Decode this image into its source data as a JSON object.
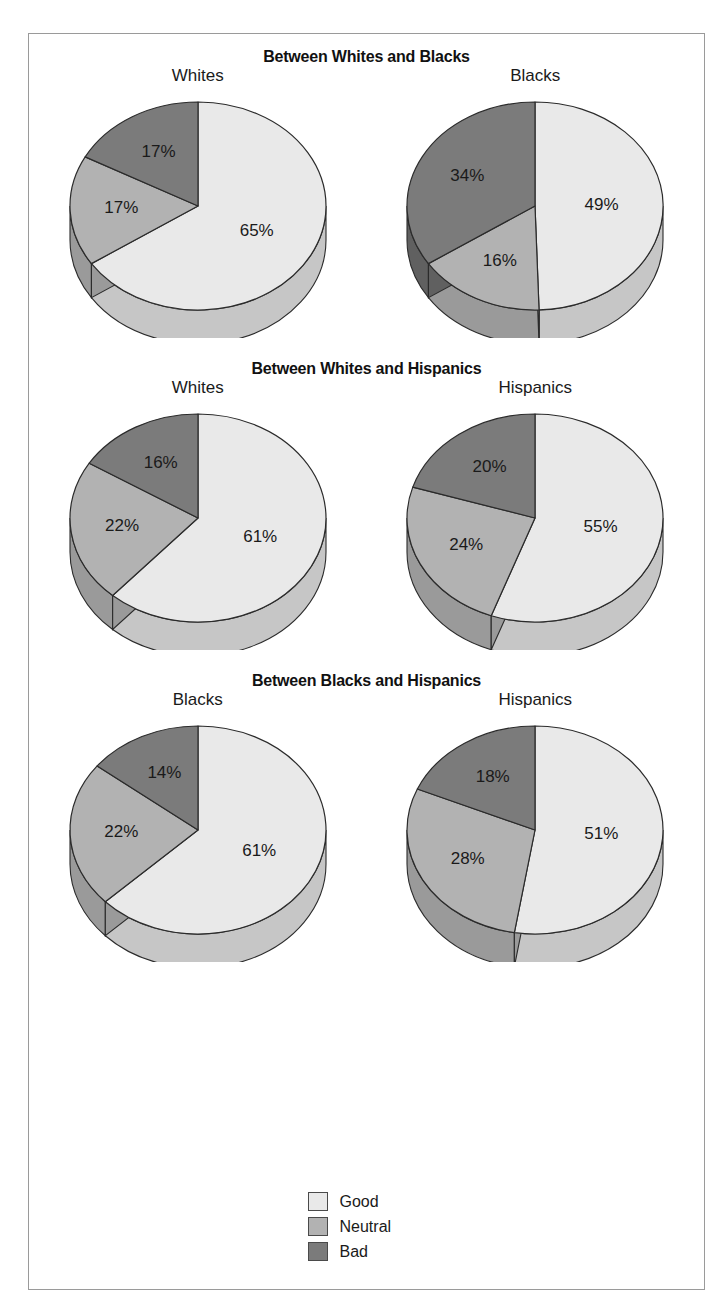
{
  "colors": {
    "good": "#e9e9e9",
    "good_side": "#c6c6c6",
    "neutral": "#b2b2b2",
    "neutral_side": "#9a9a9a",
    "bad": "#7b7b7b",
    "bad_side": "#606060",
    "outline": "#2b2b2b",
    "frame": "#9a9a9a",
    "text": "#1a1a1a"
  },
  "legend": {
    "items": [
      {
        "label": "Good",
        "color": "#e9e9e9"
      },
      {
        "label": "Neutral",
        "color": "#b2b2b2"
      },
      {
        "label": "Bad",
        "color": "#7b7b7b"
      }
    ]
  },
  "panels": [
    {
      "title": "Between Whites and Blacks",
      "charts": [
        {
          "group": "Whites",
          "slices": [
            {
              "category": "Good",
              "value": 65,
              "label": "65%"
            },
            {
              "category": "Neutral",
              "value": 17,
              "label": "17%"
            },
            {
              "category": "Bad",
              "value": 17,
              "label": "17%"
            }
          ]
        },
        {
          "group": "Blacks",
          "slices": [
            {
              "category": "Good",
              "value": 49,
              "label": "49%"
            },
            {
              "category": "Neutral",
              "value": 16,
              "label": "16%"
            },
            {
              "category": "Bad",
              "value": 34,
              "label": "34%"
            }
          ]
        }
      ]
    },
    {
      "title": "Between Whites and Hispanics",
      "charts": [
        {
          "group": "Whites",
          "slices": [
            {
              "category": "Good",
              "value": 61,
              "label": "61%"
            },
            {
              "category": "Neutral",
              "value": 22,
              "label": "22%"
            },
            {
              "category": "Bad",
              "value": 16,
              "label": "16%"
            }
          ]
        },
        {
          "group": "Hispanics",
          "slices": [
            {
              "category": "Good",
              "value": 55,
              "label": "55%"
            },
            {
              "category": "Neutral",
              "value": 24,
              "label": "24%"
            },
            {
              "category": "Bad",
              "value": 20,
              "label": "20%"
            }
          ]
        }
      ]
    },
    {
      "title": "Between Blacks and Hispanics",
      "charts": [
        {
          "group": "Blacks",
          "slices": [
            {
              "category": "Good",
              "value": 61,
              "label": "61%"
            },
            {
              "category": "Neutral",
              "value": 22,
              "label": "22%"
            },
            {
              "category": "Bad",
              "value": 14,
              "label": "14%"
            }
          ]
        },
        {
          "group": "Hispanics",
          "slices": [
            {
              "category": "Good",
              "value": 51,
              "label": "51%"
            },
            {
              "category": "Neutral",
              "value": 28,
              "label": "28%"
            },
            {
              "category": "Bad",
              "value": 18,
              "label": "18%"
            }
          ]
        }
      ]
    }
  ],
  "chart_data": {
    "type": "pie",
    "categories": [
      "Good",
      "Neutral",
      "Bad"
    ],
    "legend_position": "bottom-center",
    "note": "Six 3D pie charts arranged as three paired panels; slices begin at 12 o'clock and proceed clockwise in the order Good, Neutral, Bad.",
    "charts": [
      {
        "panel": "Between Whites and Blacks",
        "group": "Whites",
        "values": [
          65,
          17,
          17
        ],
        "labels": [
          "65%",
          "17%",
          "17%"
        ]
      },
      {
        "panel": "Between Whites and Blacks",
        "group": "Blacks",
        "values": [
          49,
          16,
          34
        ],
        "labels": [
          "49%",
          "16%",
          "34%"
        ]
      },
      {
        "panel": "Between Whites and Hispanics",
        "group": "Whites",
        "values": [
          61,
          22,
          16
        ],
        "labels": [
          "61%",
          "22%",
          "16%"
        ]
      },
      {
        "panel": "Between Whites and Hispanics",
        "group": "Hispanics",
        "values": [
          55,
          24,
          20
        ],
        "labels": [
          "55%",
          "24%",
          "20%"
        ]
      },
      {
        "panel": "Between Blacks and Hispanics",
        "group": "Blacks",
        "values": [
          61,
          22,
          14
        ],
        "labels": [
          "61%",
          "22%",
          "14%"
        ]
      },
      {
        "panel": "Between Blacks and Hispanics",
        "group": "Hispanics",
        "values": [
          51,
          28,
          18
        ],
        "labels": [
          "51%",
          "28%",
          "18%"
        ]
      }
    ]
  }
}
